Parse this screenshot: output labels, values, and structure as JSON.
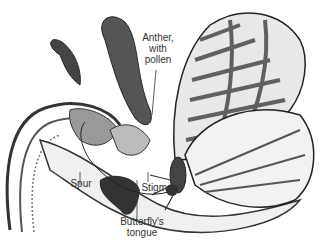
{
  "labels": {
    "anther": [
      "Anther,",
      "with",
      "pollen"
    ],
    "spur": "Spur",
    "stigma": "Stigma",
    "tongue": [
      "Butterfly's",
      "tongue"
    ]
  },
  "colors": {
    "ink": "#222222",
    "text": "#333333",
    "background": "#ffffff"
  }
}
